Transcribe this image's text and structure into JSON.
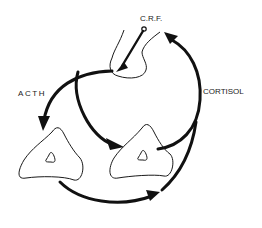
{
  "labels": {
    "crf": "C.R.F.",
    "acth": "ACTH",
    "cortisol": "CORTISOL"
  },
  "nodes": [
    {
      "id": "hypothalamus",
      "shape": "blob"
    },
    {
      "id": "adrenal-left",
      "shape": "triangle"
    },
    {
      "id": "adrenal-right",
      "shape": "triangle"
    }
  ],
  "edges": [
    {
      "from": "crf-pipette",
      "to": "hypothalamus",
      "label": "C.R.F."
    },
    {
      "from": "hypothalamus",
      "to": "adrenal-left",
      "label": "ACTH"
    },
    {
      "from": "hypothalamus",
      "to": "adrenal-right",
      "label": ""
    },
    {
      "from": "adrenal-right",
      "to": "hypothalamus",
      "label": "CORTISOL"
    },
    {
      "from": "adrenal-left",
      "to": "adrenal-right-loop",
      "label": ""
    }
  ],
  "colors": {
    "ink": "#111111",
    "background": "#ffffff"
  }
}
